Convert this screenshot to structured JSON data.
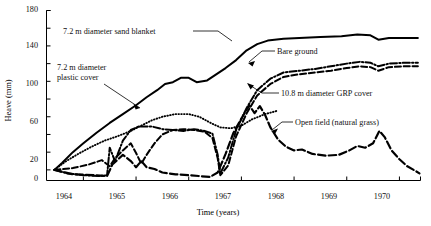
{
  "chart_data": {
    "type": "line",
    "title": "",
    "xlabel": "Time (years)",
    "ylabel": "Heave (mm)",
    "xlim": [
      1963.3,
      1970.4
    ],
    "ylim": [
      -12,
      180
    ],
    "grid": false,
    "legend_position": "inline-annotations",
    "xticks": [
      1964,
      1965,
      1966,
      1967,
      1968,
      1969,
      1970
    ],
    "xtick_labels": [
      "1964",
      "1965",
      "1966",
      "1967",
      "1968",
      "1969",
      "1970"
    ],
    "yticks": [
      0,
      20,
      40,
      60,
      80,
      100,
      120,
      140,
      160,
      180
    ],
    "ytick_labels": [
      "0",
      "20",
      "",
      "60",
      "",
      "100",
      "",
      "140",
      "",
      "180"
    ],
    "series": [
      {
        "name": "7.2 m diameter sand blanket",
        "style": "solid",
        "points": [
          [
            1963.45,
            0
          ],
          [
            1963.6,
            8
          ],
          [
            1963.8,
            20
          ],
          [
            1964.0,
            30
          ],
          [
            1964.25,
            42
          ],
          [
            1964.5,
            53
          ],
          [
            1964.75,
            63
          ],
          [
            1965.0,
            73
          ],
          [
            1965.2,
            82
          ],
          [
            1965.4,
            90
          ],
          [
            1965.55,
            97
          ],
          [
            1965.7,
            99
          ],
          [
            1965.85,
            104
          ],
          [
            1966.0,
            104
          ],
          [
            1966.15,
            99
          ],
          [
            1966.35,
            101
          ],
          [
            1966.5,
            107
          ],
          [
            1966.7,
            115
          ],
          [
            1966.9,
            124
          ],
          [
            1967.1,
            135
          ],
          [
            1967.3,
            142
          ],
          [
            1967.5,
            146
          ],
          [
            1967.8,
            148
          ],
          [
            1968.1,
            149
          ],
          [
            1968.5,
            150
          ],
          [
            1968.9,
            151
          ],
          [
            1969.2,
            153
          ],
          [
            1969.45,
            152
          ],
          [
            1969.6,
            147
          ],
          [
            1969.8,
            149
          ],
          [
            1970.1,
            149
          ],
          [
            1970.35,
            149
          ]
        ]
      },
      {
        "name": "7.2 m diameter plastic cover",
        "style": "dotted",
        "points": [
          [
            1963.45,
            0
          ],
          [
            1963.65,
            9
          ],
          [
            1963.9,
            18
          ],
          [
            1964.15,
            26
          ],
          [
            1964.4,
            33
          ],
          [
            1964.65,
            38
          ],
          [
            1964.9,
            44
          ],
          [
            1965.1,
            50
          ],
          [
            1965.3,
            56
          ],
          [
            1965.5,
            60
          ],
          [
            1965.75,
            63
          ],
          [
            1966.0,
            63
          ],
          [
            1966.2,
            60
          ],
          [
            1966.45,
            52
          ],
          [
            1966.6,
            48
          ],
          [
            1966.8,
            47
          ],
          [
            1967.0,
            50
          ],
          [
            1967.2,
            57
          ],
          [
            1967.45,
            63
          ],
          [
            1967.7,
            67
          ]
        ]
      },
      {
        "name": "Bare ground",
        "style": "dashdot",
        "points": [
          [
            1963.45,
            0
          ],
          [
            1963.7,
            -4
          ],
          [
            1964.0,
            -6
          ],
          [
            1964.3,
            -7
          ],
          [
            1964.45,
            -6
          ],
          [
            1964.5,
            25
          ],
          [
            1964.6,
            10
          ],
          [
            1964.75,
            33
          ],
          [
            1964.9,
            45
          ],
          [
            1965.05,
            49
          ],
          [
            1965.3,
            49
          ],
          [
            1965.5,
            46
          ],
          [
            1965.7,
            45
          ],
          [
            1965.9,
            44
          ],
          [
            1966.1,
            46
          ],
          [
            1966.3,
            44
          ],
          [
            1966.45,
            41
          ],
          [
            1966.55,
            17
          ],
          [
            1966.6,
            -4
          ],
          [
            1966.75,
            14
          ],
          [
            1966.9,
            45
          ],
          [
            1967.1,
            70
          ],
          [
            1967.3,
            90
          ],
          [
            1967.55,
            103
          ],
          [
            1967.8,
            110
          ],
          [
            1968.1,
            112
          ],
          [
            1968.4,
            114
          ],
          [
            1968.7,
            117
          ],
          [
            1969.0,
            120
          ],
          [
            1969.25,
            122
          ],
          [
            1969.45,
            121
          ],
          [
            1969.6,
            117
          ],
          [
            1969.8,
            120
          ],
          [
            1970.1,
            121
          ],
          [
            1970.35,
            121
          ]
        ]
      },
      {
        "name": "10.8 m diameter GRP cover",
        "style": "dashed",
        "points": [
          [
            1963.45,
            0
          ],
          [
            1963.8,
            2
          ],
          [
            1964.1,
            6
          ],
          [
            1964.35,
            11
          ],
          [
            1964.5,
            4
          ],
          [
            1964.6,
            13
          ],
          [
            1964.75,
            22
          ],
          [
            1964.9,
            30
          ],
          [
            1965.0,
            19
          ],
          [
            1965.1,
            7
          ],
          [
            1965.2,
            17
          ],
          [
            1965.35,
            30
          ],
          [
            1965.5,
            40
          ],
          [
            1965.7,
            45
          ],
          [
            1965.9,
            46
          ],
          [
            1966.1,
            45
          ],
          [
            1966.3,
            43
          ],
          [
            1966.45,
            36
          ],
          [
            1966.55,
            13
          ],
          [
            1966.6,
            -6
          ],
          [
            1966.75,
            5
          ],
          [
            1966.9,
            38
          ],
          [
            1967.1,
            64
          ],
          [
            1967.3,
            84
          ],
          [
            1967.55,
            97
          ],
          [
            1967.8,
            105
          ],
          [
            1968.1,
            108
          ],
          [
            1968.4,
            110
          ],
          [
            1968.7,
            112
          ],
          [
            1969.0,
            115
          ],
          [
            1969.25,
            117
          ],
          [
            1969.45,
            116
          ],
          [
            1969.6,
            112
          ],
          [
            1969.8,
            116
          ],
          [
            1970.1,
            117
          ],
          [
            1970.35,
            117
          ]
        ]
      },
      {
        "name": "Open field (natural grass)",
        "style": "longdash",
        "points": [
          [
            1963.45,
            0
          ],
          [
            1963.8,
            -5
          ],
          [
            1964.2,
            -6
          ],
          [
            1964.45,
            -7
          ],
          [
            1964.55,
            6
          ],
          [
            1964.75,
            17
          ],
          [
            1964.9,
            10
          ],
          [
            1965.0,
            3
          ],
          [
            1965.1,
            10
          ],
          [
            1965.2,
            3
          ],
          [
            1965.35,
            1
          ],
          [
            1965.5,
            -3
          ],
          [
            1965.75,
            -5
          ],
          [
            1966.0,
            -6
          ],
          [
            1966.2,
            -7
          ],
          [
            1966.4,
            -8
          ],
          [
            1966.55,
            -3
          ],
          [
            1966.7,
            18
          ],
          [
            1966.85,
            42
          ],
          [
            1967.0,
            58
          ],
          [
            1967.15,
            73
          ],
          [
            1967.25,
            64
          ],
          [
            1967.35,
            72
          ],
          [
            1967.45,
            62
          ],
          [
            1967.55,
            48
          ],
          [
            1967.7,
            34
          ],
          [
            1967.85,
            26
          ],
          [
            1968.0,
            22
          ],
          [
            1968.15,
            23
          ],
          [
            1968.35,
            18
          ],
          [
            1968.6,
            16
          ],
          [
            1968.85,
            17
          ],
          [
            1969.05,
            22
          ],
          [
            1969.2,
            27
          ],
          [
            1969.35,
            25
          ],
          [
            1969.5,
            30
          ],
          [
            1969.62,
            44
          ],
          [
            1969.72,
            37
          ],
          [
            1969.85,
            22
          ],
          [
            1970.0,
            12
          ],
          [
            1970.15,
            4
          ],
          [
            1970.3,
            -1
          ],
          [
            1970.38,
            -4
          ]
        ]
      }
    ],
    "annotations": [
      {
        "key": "sand_blanket",
        "text": "7.2 m diameter sand blanket"
      },
      {
        "key": "plastic_cover",
        "text": "7.2 m diameter\nplastic cover"
      },
      {
        "key": "bare_ground",
        "text": "Bare ground"
      },
      {
        "key": "grp_cover",
        "text": "10.8 m diameter GRP cover"
      },
      {
        "key": "open_field",
        "text": "Open field (natural grass)"
      }
    ]
  },
  "labels": {
    "ylabel": "Heave (mm)",
    "xlabel": "Time (years)",
    "ann_sand_blanket": "7.2 m diameter sand blanket",
    "ann_plastic_cover_l1": "7.2 m diameter",
    "ann_plastic_cover_l2": "plastic cover",
    "ann_bare_ground": "Bare ground",
    "ann_grp_cover": "10.8 m diameter GRP cover",
    "ann_open_field": "Open field (natural grass)",
    "y0": "0",
    "y20": "20",
    "y60": "60",
    "y100": "100",
    "y140": "140",
    "y180": "180",
    "x1964": "1964",
    "x1965": "1965",
    "x1966": "1966",
    "x1967": "1967",
    "x1968": "1968",
    "x1969": "1969",
    "x1970": "1970"
  },
  "colors": {
    "ink": "#000000",
    "background": "#ffffff"
  }
}
